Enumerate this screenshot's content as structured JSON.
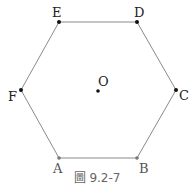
{
  "figure": {
    "caption": "圖 9.2-7",
    "shape": "regular-hexagon",
    "stroke_color": "#8a8a8a",
    "point_color": "#111111",
    "vertices": [
      {
        "name": "A",
        "x": 59,
        "y": 158
      },
      {
        "name": "B",
        "x": 137,
        "y": 158
      },
      {
        "name": "C",
        "x": 176,
        "y": 90
      },
      {
        "name": "D",
        "x": 137,
        "y": 22
      },
      {
        "name": "E",
        "x": 59,
        "y": 22
      },
      {
        "name": "F",
        "x": 21,
        "y": 90
      }
    ],
    "center": {
      "name": "O",
      "x": 98,
      "y": 91
    }
  },
  "labels": {
    "A": "A",
    "B": "B",
    "C": "C",
    "D": "D",
    "E": "E",
    "F": "F",
    "O": "O"
  }
}
